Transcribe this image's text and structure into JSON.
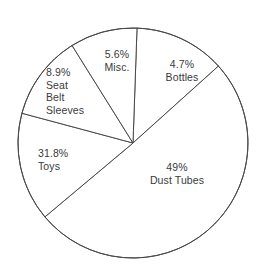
{
  "chart_data": {
    "type": "pie",
    "title": "",
    "subtitle": "",
    "xlabel": "",
    "ylabel": "",
    "legend_position": "none",
    "grid": false,
    "labels_inside_slices": true,
    "units": "percent",
    "total": 100,
    "categories": [
      "Bottles",
      "Dust Tubes",
      "Toys",
      "Seat Belt Sleeves",
      "Misc."
    ],
    "values": [
      4.7,
      49,
      31.8,
      8.9,
      5.6
    ],
    "value_labels": [
      "4.7%",
      "49%",
      "31.8%",
      "8.9%",
      "5.6%"
    ],
    "slices": [
      {
        "name": "Bottles",
        "value": 4.7,
        "percent_label": "4.7%",
        "name_lines": [
          "Bottles"
        ],
        "start_angle_deg": 2,
        "end_angle_deg": 48,
        "fill": "#ffffff",
        "stroke": "#4a4a4a"
      },
      {
        "name": "Dust Tubes",
        "value": 49,
        "percent_label": "49%",
        "name_lines": [
          "Dust Tubes"
        ],
        "start_angle_deg": 48,
        "end_angle_deg": 230,
        "fill": "#ffffff",
        "stroke": "#4a4a4a"
      },
      {
        "name": "Toys",
        "value": 31.8,
        "percent_label": "31.8%",
        "name_lines": [
          "Toys"
        ],
        "start_angle_deg": 230,
        "end_angle_deg": 285,
        "fill": "#ffffff",
        "stroke": "#4a4a4a"
      },
      {
        "name": "Seat Belt Sleeves",
        "value": 8.9,
        "percent_label": "8.9%",
        "name_lines": [
          "Seat",
          "Belt",
          "Sleeves"
        ],
        "start_angle_deg": 285,
        "end_angle_deg": 328,
        "fill": "#ffffff",
        "stroke": "#4a4a4a"
      },
      {
        "name": "Misc.",
        "value": 5.6,
        "percent_label": "5.6%",
        "name_lines": [
          "Misc."
        ],
        "start_angle_deg": 328,
        "end_angle_deg": 362,
        "fill": "#ffffff",
        "stroke": "#4a4a4a"
      }
    ],
    "geometry": {
      "center_x": 133,
      "center_y": 143,
      "radius": 115
    },
    "colors": {
      "background": "#ffffff",
      "stroke": "#4a4a4a",
      "text": "#3a3a3a"
    }
  },
  "labels": {
    "bottles": {
      "pct": "4.7%",
      "name": "Bottles"
    },
    "misc": {
      "pct": "5.6%",
      "name": "Misc."
    },
    "seatbelt": {
      "pct": "8.9%",
      "line1": "Seat",
      "line2": "Belt",
      "line3": "Sleeves"
    },
    "toys": {
      "pct": "31.8%",
      "name": "Toys"
    },
    "dust": {
      "pct": "49%",
      "name": "Dust Tubes"
    }
  }
}
